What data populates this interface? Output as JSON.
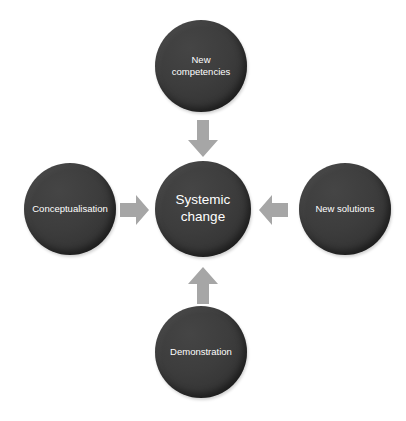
{
  "diagram": {
    "title": "Systemic change",
    "background_color": "#ffffff",
    "node_color": "#3b3b3b",
    "node_text_color": "#ffffff",
    "arrow_color": "#a6a6a6",
    "center": {
      "id": "systemic-change",
      "label": "Systemic\nchange"
    },
    "nodes": [
      {
        "id": "new-competencies",
        "label": "New\ncompetencies",
        "position": "top"
      },
      {
        "id": "conceptualisation",
        "label": "Conceptualisation",
        "position": "left"
      },
      {
        "id": "new-solutions",
        "label": "New solutions",
        "position": "right"
      },
      {
        "id": "demonstration",
        "label": "Demonstration",
        "position": "bottom"
      }
    ],
    "arrows": [
      {
        "id": "arrow-top",
        "from": "new-competencies",
        "to": "systemic-change",
        "direction": "down"
      },
      {
        "id": "arrow-left",
        "from": "conceptualisation",
        "to": "systemic-change",
        "direction": "right"
      },
      {
        "id": "arrow-right",
        "from": "new-solutions",
        "to": "systemic-change",
        "direction": "left"
      },
      {
        "id": "arrow-bottom",
        "from": "demonstration",
        "to": "systemic-change",
        "direction": "up"
      }
    ]
  }
}
